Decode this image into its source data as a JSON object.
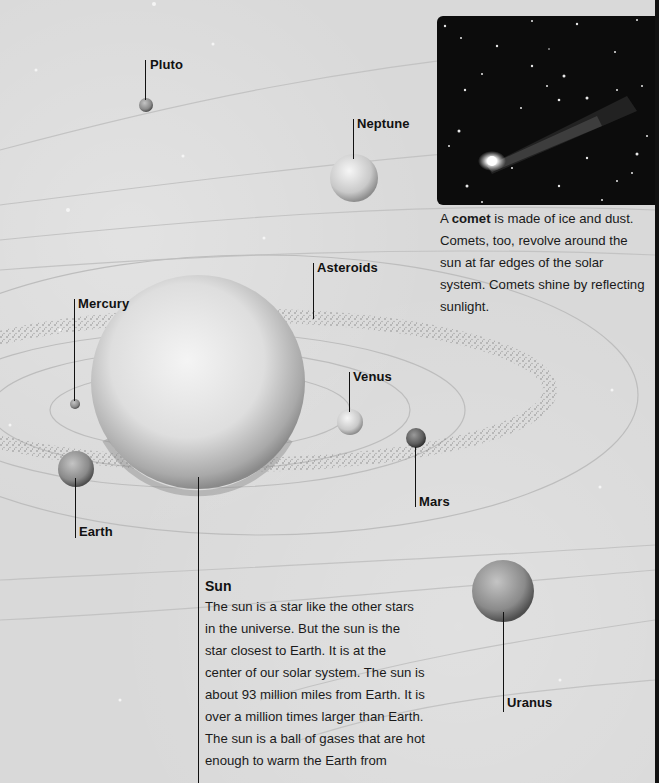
{
  "labels": {
    "pluto": "Pluto",
    "neptune": "Neptune",
    "asteroids": "Asteroids",
    "mercury": "Mercury",
    "venus": "Venus",
    "mars": "Mars",
    "earth": "Earth",
    "uranus": "Uranus"
  },
  "comet": {
    "intro": "A ",
    "bold_word": "comet",
    "text": " is made of ice and dust. Comets, too, revolve around the sun at far edges of the solar system. Comets shine by reflecting sunlight."
  },
  "sun": {
    "title": "Sun",
    "text": "The sun is a star like the other stars in the universe. But the sun is the star closest to Earth. It is at the center of our solar system. The sun is about 93 million miles from Earth. It is over a million times larger than Earth. The sun is a ball of gases that are hot enough to warm the Earth from"
  },
  "colors": {
    "background": "#d9d9d9",
    "text": "#111111",
    "photo_bg": "#0c0c0c"
  }
}
